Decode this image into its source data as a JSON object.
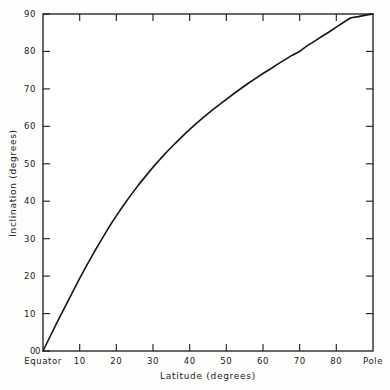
{
  "chart_data": {
    "type": "line",
    "title": "",
    "subtitle": "",
    "xlabel": "Latitude (degrees)",
    "ylabel": "Inclination (degrees)",
    "xlim": [
      0,
      90
    ],
    "ylim": [
      0,
      90
    ],
    "grid": false,
    "legend": null,
    "x_tick_labels": [
      "0",
      "10",
      "20",
      "30",
      "40",
      "50",
      "60",
      "70",
      "80",
      "90"
    ],
    "x_tick_display": [
      "Equator",
      "10",
      "20",
      "30",
      "40",
      "50",
      "60",
      "70",
      "80",
      "Pole"
    ],
    "x_ticks": [
      0,
      10,
      20,
      30,
      40,
      50,
      60,
      70,
      80,
      90
    ],
    "y_tick_labels": [
      "0",
      "10",
      "20",
      "30",
      "40",
      "50",
      "60",
      "70",
      "80",
      "90"
    ],
    "y_ticks": [
      0,
      10,
      20,
      30,
      40,
      50,
      60,
      70,
      80,
      90
    ],
    "origin_label": "0",
    "equator_label": "Equator",
    "pole_label": "Pole",
    "series": [
      {
        "name": "Dipole inclination",
        "relation": "tan(I) = 2 tan(latitude)",
        "color": "#151515",
        "x": [
          0,
          2,
          4,
          6,
          8,
          10,
          12,
          14,
          16,
          18,
          20,
          22,
          24,
          26,
          28,
          30,
          32,
          34,
          36,
          38,
          40,
          42,
          44,
          46,
          48,
          50,
          52,
          54,
          56,
          58,
          60,
          62,
          64,
          66,
          68,
          70,
          72,
          74,
          76,
          78,
          80,
          82,
          84,
          86,
          88,
          90
        ],
        "values": [
          0.0,
          4.0,
          8.0,
          11.8,
          15.6,
          19.4,
          23.0,
          26.5,
          29.8,
          33.1,
          36.1,
          39.0,
          41.7,
          44.3,
          46.7,
          49.1,
          51.3,
          53.4,
          55.4,
          57.3,
          59.2,
          60.9,
          62.6,
          64.2,
          65.7,
          67.2,
          68.7,
          70.1,
          71.5,
          72.8,
          74.1,
          75.3,
          76.6,
          77.8,
          79.0,
          80.0,
          81.5,
          82.7,
          84.0,
          85.2,
          86.5,
          87.8,
          89.0,
          89.3,
          89.7,
          90.0
        ]
      }
    ]
  },
  "axes": {
    "x_title": "Latitude (degrees)",
    "y_title": "Inclination (degrees)",
    "frame_color": "#1a1a1a"
  }
}
